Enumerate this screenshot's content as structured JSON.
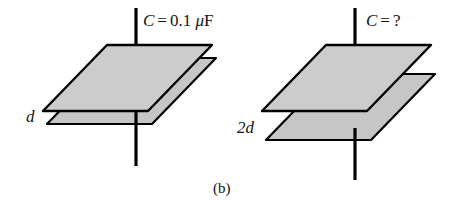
{
  "figure": {
    "caption": "(b)",
    "background_color": "#ffffff",
    "line_color": "#000000",
    "plate_fill_top": "#cccccc",
    "plate_fill_bottom": "#c4c4c4"
  },
  "capacitors": [
    {
      "id": "left",
      "capacitance_label_symbol": "C",
      "capacitance_label_operator": "=",
      "capacitance_label_value": "0.1",
      "capacitance_label_mu": "μ",
      "capacitance_label_unit": "F",
      "separation_label": "d"
    },
    {
      "id": "right",
      "capacitance_label_symbol": "C",
      "capacitance_label_operator": "=",
      "capacitance_label_value": "?",
      "capacitance_label_mu": "",
      "capacitance_label_unit": "",
      "separation_label": "2d"
    }
  ]
}
